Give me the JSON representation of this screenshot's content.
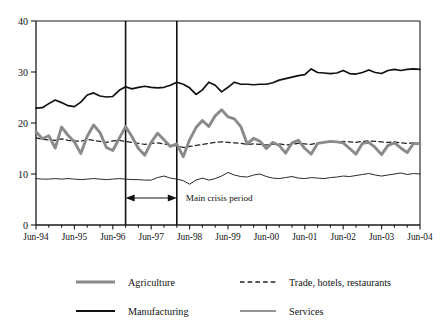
{
  "chart_data": {
    "type": "line",
    "title": "",
    "subtitle": "",
    "xlabel": "",
    "ylabel": "",
    "ylim": [
      0,
      40
    ],
    "yticks": [
      0,
      10,
      20,
      30,
      40
    ],
    "grid": false,
    "legend_position": "bottom",
    "x_tick_labels": [
      "Jun-94",
      "Jun-95",
      "Jun-96",
      "Jun-97",
      "Jun-98",
      "Jun-99",
      "Jun-00",
      "Jun-01",
      "Jun-02",
      "Jun-03",
      "Jun-04"
    ],
    "x_start": "Jun-94",
    "x_end": "Jun-04",
    "x_step_label": "quarterly",
    "annotations": [
      {
        "text": "Main crisis period",
        "type": "double-arrow-span",
        "from": "Dec-97",
        "to": "Dec-99"
      }
    ],
    "series": [
      {
        "name": "Agriculture",
        "style": "solid-thick-gray",
        "color": "#8a8a8a",
        "values": [
          18.3,
          16.9,
          17.5,
          15.1,
          19.2,
          17.6,
          16.3,
          14.0,
          17.4,
          19.6,
          18.1,
          15.2,
          14.6,
          17.0,
          19.3,
          17.3,
          15.0,
          13.7,
          16.2,
          18.0,
          16.7,
          15.4,
          15.9,
          13.4,
          16.7,
          19.1,
          20.5,
          19.3,
          21.4,
          22.6,
          21.2,
          20.8,
          19.3,
          15.9,
          17.0,
          16.4,
          15.0,
          16.2,
          15.6,
          14.1,
          16.1,
          16.6,
          15.0,
          13.9,
          16.0,
          16.2,
          16.4,
          16.3,
          16.1,
          15.0,
          13.9,
          16.0,
          16.2,
          15.2,
          13.8,
          15.6,
          16.1,
          15.1,
          14.2,
          16.0,
          15.9
        ]
      },
      {
        "name": "Manufacturing",
        "style": "solid-black",
        "color": "#111111",
        "values": [
          22.9,
          23.0,
          23.8,
          24.5,
          24.0,
          23.4,
          23.2,
          24.1,
          25.5,
          25.9,
          25.3,
          25.1,
          25.2,
          26.4,
          27.1,
          26.7,
          27.0,
          27.2,
          27.0,
          26.9,
          27.0,
          27.4,
          28.0,
          27.6,
          26.9,
          25.6,
          26.5,
          28.0,
          27.4,
          26.1,
          27.0,
          28.0,
          27.6,
          27.6,
          27.5,
          27.6,
          27.6,
          27.9,
          28.4,
          28.7,
          29.0,
          29.3,
          29.5,
          30.6,
          29.9,
          29.8,
          29.7,
          29.8,
          30.3,
          29.7,
          29.6,
          29.9,
          30.4,
          29.9,
          29.7,
          30.3,
          30.5,
          30.3,
          30.5,
          30.6,
          30.5
        ]
      },
      {
        "name": "Trade, hotels, restaurants",
        "style": "dashed",
        "color": "#222222",
        "values": [
          17.1,
          16.8,
          16.7,
          16.6,
          16.9,
          16.6,
          16.5,
          16.4,
          16.8,
          16.6,
          16.4,
          16.2,
          16.5,
          16.6,
          16.4,
          16.2,
          16.0,
          15.8,
          16.0,
          16.1,
          15.9,
          15.7,
          15.5,
          15.2,
          15.4,
          15.6,
          15.8,
          16.0,
          16.2,
          16.3,
          16.2,
          16.1,
          16.0,
          15.8,
          15.9,
          15.8,
          15.7,
          15.8,
          15.9,
          15.7,
          15.8,
          16.0,
          15.9,
          15.8,
          16.1,
          16.2,
          16.3,
          16.2,
          16.4,
          16.3,
          16.2,
          16.4,
          16.5,
          16.4,
          16.3,
          16.2,
          16.3,
          16.1,
          16.0,
          16.1,
          16.0
        ]
      },
      {
        "name": "Services",
        "style": "solid-thin",
        "color": "#2a2a2a",
        "values": [
          9.1,
          9.0,
          9.0,
          9.1,
          9.0,
          9.1,
          9.0,
          8.9,
          9.0,
          9.1,
          9.0,
          8.9,
          9.0,
          9.1,
          9.0,
          8.9,
          8.9,
          8.8,
          8.8,
          9.3,
          9.6,
          9.2,
          9.0,
          8.7,
          8.0,
          8.8,
          9.2,
          8.8,
          9.1,
          9.6,
          10.3,
          9.8,
          9.5,
          9.4,
          9.8,
          10.0,
          9.5,
          9.2,
          9.1,
          9.3,
          9.5,
          9.2,
          9.1,
          9.3,
          9.2,
          9.1,
          9.3,
          9.4,
          9.6,
          9.5,
          9.7,
          9.9,
          10.1,
          9.8,
          9.6,
          9.8,
          10.0,
          10.2,
          9.9,
          10.1,
          10.0
        ]
      }
    ]
  },
  "legend": {
    "items": [
      {
        "label": "Agriculture",
        "key": "agriculture"
      },
      {
        "label": "Manufacturing",
        "key": "manufacturing"
      },
      {
        "label": "Trade, hotels, restaurants",
        "key": "trade"
      },
      {
        "label": "Services",
        "key": "services"
      }
    ]
  },
  "annotation": {
    "crisis_label": "Main crisis period"
  },
  "axis": {
    "y_labels": [
      "40",
      "30",
      "20",
      "10",
      "0"
    ],
    "x_labels": [
      "Jun-94",
      "Jun-95",
      "Jun-96",
      "Jun-97",
      "Jun-98",
      "Jun-99",
      "Jun-00",
      "Jun-01",
      "Jun-02",
      "Jun-03",
      "Jun-04"
    ]
  }
}
